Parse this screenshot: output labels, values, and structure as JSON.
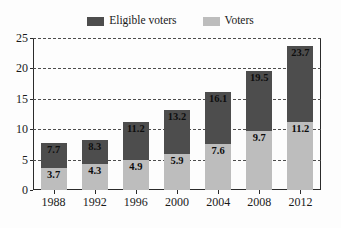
{
  "chart_data": {
    "type": "bar",
    "subtype": "stacked-bar",
    "title": "",
    "subtitle": "",
    "xlabel": "",
    "ylabel": "",
    "categories": [
      "1988",
      "1992",
      "1996",
      "2000",
      "2004",
      "2008",
      "2012"
    ],
    "series": [
      {
        "name": "Voters",
        "color": "#bdbdbd",
        "values": [
          3.7,
          4.3,
          4.9,
          5.9,
          7.6,
          9.7,
          11.2
        ],
        "labels": [
          "3.7",
          "4.3",
          "4.9",
          "5.9",
          "7.6",
          "9.7",
          "11.2"
        ]
      },
      {
        "name": "Eligible voters",
        "color": "#4d4d4d",
        "values": [
          7.7,
          8.3,
          11.2,
          13.2,
          16.1,
          19.5,
          23.7
        ],
        "labels": [
          "7.7",
          "8.3",
          "11.2",
          "13.2",
          "16.1",
          "19.5",
          "23.7"
        ],
        "note": "cumulative total height of each bar"
      }
    ],
    "ylim": [
      0,
      25
    ],
    "yticks": [
      0,
      5,
      10,
      15,
      20,
      25
    ],
    "ytick_labels": [
      "0",
      "5",
      "10",
      "15",
      "20",
      "25"
    ],
    "grid": true,
    "grid_style": "dashed-horizontal",
    "legend_position": "top-center"
  },
  "legend": {
    "entries": [
      {
        "label": "Eligible voters",
        "color": "#4d4d4d"
      },
      {
        "label": "Voters",
        "color": "#bdbdbd"
      }
    ]
  },
  "colors": {
    "eligible_voters": "#4d4d4d",
    "voters": "#bdbdbd",
    "axis": "#2b2b2b",
    "grid": "#4d4d4d",
    "text": "#1a1a1a",
    "background": "#fdfdfd"
  }
}
